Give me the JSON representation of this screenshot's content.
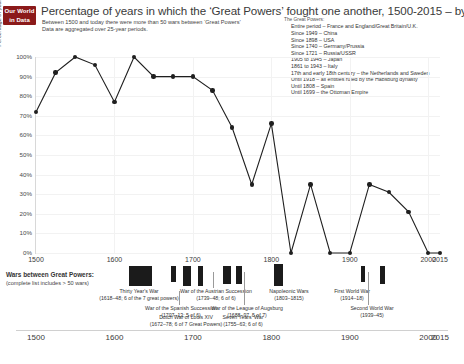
{
  "brand": {
    "line1": "Our World",
    "line2": "in Data"
  },
  "header": {
    "title": "Percentage of years in which the ‘Great Powers’ fought one another, 1500-2015 – by Max Roser",
    "subtitle_1": "Between 1500 and today there were more than 50 wars between ‘Great Powers’",
    "subtitle_2": "Data are aggregated over 25-year periods."
  },
  "legend": {
    "title": "The Great Powers:",
    "items": [
      "Entire period – France and England/Great Britain/U.K.",
      "Since 1949 – China",
      "Since 1898 – USA",
      "Since 1740 – Germany/Prussia",
      "Since 1721 – Russia/USSR",
      "1905 to 1945 – Japan",
      "1861 to 1943 – Italy",
      "17th and early 18th century – the Netherlands and Sweden",
      "Until 1918 – all entities ruled by the Habsburg dynasty",
      "Until 1808 – Spain",
      "Until 1699 – the Ottoman Empire"
    ]
  },
  "chart_data": {
    "type": "line",
    "title": "Percentage of years in which the ‘Great Powers’ fought one another, 1500-2015",
    "xlabel": "",
    "ylabel": "Percentage of years in which the great powers fought one another",
    "xlim": [
      1500,
      2015
    ],
    "ylim": [
      0,
      100
    ],
    "grid": true,
    "legend_position": "top-right",
    "x": [
      1500,
      1525,
      1550,
      1575,
      1600,
      1625,
      1650,
      1675,
      1700,
      1725,
      1750,
      1775,
      1800,
      1825,
      1850,
      1875,
      1900,
      1925,
      1950,
      1975,
      2000,
      2015
    ],
    "values": [
      72,
      92,
      100,
      96,
      77,
      100,
      90,
      90,
      90,
      83,
      64,
      35,
      66,
      0,
      35,
      0,
      0,
      35,
      31,
      21,
      0,
      0
    ],
    "y_ticks": [
      "0%",
      "10%",
      "20%",
      "30%",
      "40%",
      "50%",
      "60%",
      "70%",
      "80%",
      "90%",
      "100%"
    ],
    "x_ticks": [
      "1500",
      "1600",
      "1700",
      "1800",
      "1900",
      "2000",
      "2015"
    ]
  },
  "wars_panel": {
    "title": "Wars between Great Powers:",
    "subtitle": "(complete list includes > 50 wars)",
    "x_ticks": [
      "1500",
      "1600",
      "1700",
      "1800",
      "1900",
      "2000",
      "2015"
    ],
    "wars": [
      {
        "name": "Thirty Year's War",
        "dates": "(1618–48; 6 of the 7 great powers)"
      },
      {
        "name": "War of the Spanish Succession",
        "dates": "(1707–13; 5 of 6)"
      },
      {
        "name": "Dutch War of Louis XIV",
        "dates": "(1672–78; 6 of 7 Great Powers)"
      },
      {
        "name": "War of the Austrian Succession",
        "dates": "(1739–48; 6 of 6)"
      },
      {
        "name": "War of the League of Augsburg",
        "dates": "(1688–97, 5 of 7)"
      },
      {
        "name": "Seven Years' War",
        "dates": "(1755–63; 6 of 6)"
      },
      {
        "name": "Napoleonic Wars",
        "dates": "(1803–1815)"
      },
      {
        "name": "First World War",
        "dates": "(1914–18)"
      },
      {
        "name": "Second World War",
        "dates": "(1939–45)"
      }
    ]
  },
  "colors": {
    "brand": "#8b1a1a",
    "series": "#1f1f1f",
    "grid": "#f2f2f2"
  }
}
